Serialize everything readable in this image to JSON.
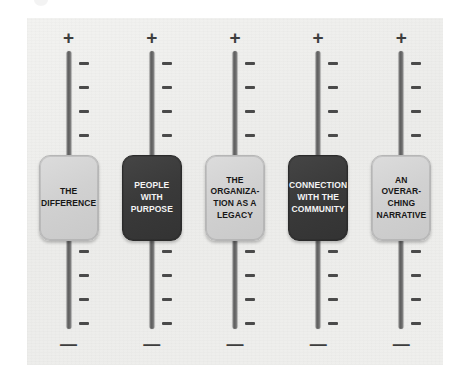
{
  "panel": {
    "background_color": "#ececea",
    "rail_color": "#6a6a6a",
    "tick_color": "#4a4a4a",
    "light_knob_color": "#d2d2d2",
    "dark_knob_color": "#3a3a3a",
    "plus_symbol": "+",
    "minus_symbol": "—",
    "ticks_above_knob": 4,
    "ticks_below_knob": 4
  },
  "faders": [
    {
      "id": "the-difference",
      "label": "THE\nDIFFERENCE",
      "style": "light",
      "plus": "+",
      "minus": "—"
    },
    {
      "id": "people-with-purpose",
      "label": "PEOPLE\nWITH\nPURPOSE",
      "style": "dark",
      "plus": "+",
      "minus": "—"
    },
    {
      "id": "the-organization-as-a-legacy",
      "label": "THE\nORGANIZA-\nTION AS A\nLEGACY",
      "style": "light",
      "plus": "+",
      "minus": "—"
    },
    {
      "id": "connection-with-the-community",
      "label": "CONNECTION\nWITH THE\nCOMMUNITY",
      "style": "dark",
      "plus": "+",
      "minus": "—"
    },
    {
      "id": "an-overarching-narrative",
      "label": "AN\nOVERAR-\nCHING\nNARRATIVE",
      "style": "light",
      "plus": "+",
      "minus": "—"
    }
  ]
}
